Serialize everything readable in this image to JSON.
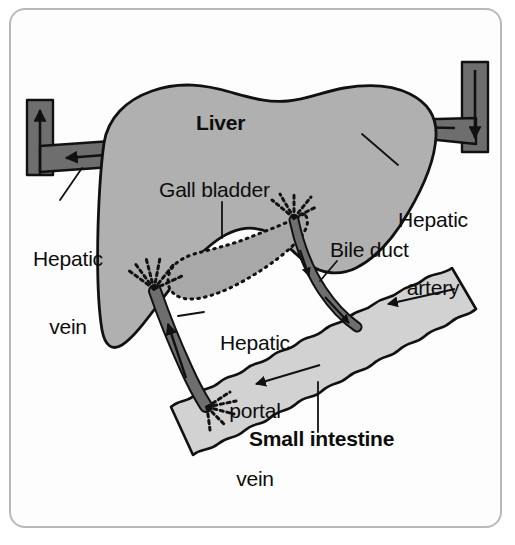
{
  "figure": {
    "kind": "anatomy-diagram",
    "border_color": "#b9b9b9",
    "background_color": "#ffffff"
  },
  "colors": {
    "liver_fill": "#b0b0b0",
    "liver_stroke": "#111111",
    "intestine_fill": "#d2d2d2",
    "intestine_stroke": "#111111",
    "vessel_fill": "#6e6e6e",
    "vessel_stroke": "#111111",
    "gallbladder_fill": "#a8a8a8",
    "gallbladder_stroke": "#111111",
    "text": "#0d0d0d",
    "leader_line": "#111111"
  },
  "labels": {
    "liver": {
      "text": "Liver",
      "weight": "bold",
      "x": 196,
      "y": 122
    },
    "gall_bladder": {
      "text": "Gall bladder",
      "weight": "regular",
      "x": 159,
      "y": 189
    },
    "hepatic_vein": {
      "line1": "Hepatic",
      "line2": "vein",
      "weight": "regular",
      "x": 18,
      "y": 213
    },
    "hepatic_artery": {
      "line1": "Hepatic",
      "line2": "artery",
      "weight": "regular",
      "x": 381,
      "y": 174
    },
    "bile_duct": {
      "text": "Bile duct",
      "weight": "regular",
      "x": 330,
      "y": 249
    },
    "hepatic_portal_vein": {
      "line1": "Hepatic",
      "line2": "portal",
      "line3": "vein",
      "weight": "regular",
      "x": 210,
      "y": 297
    },
    "small_intestine": {
      "text": "Small intestine",
      "weight": "bold",
      "x": 249,
      "y": 438
    }
  },
  "structures": [
    {
      "name": "liver",
      "type": "organ",
      "fill": "#b0b0b0"
    },
    {
      "name": "gall-bladder",
      "type": "organ",
      "outline": "dotted"
    },
    {
      "name": "small-intestine",
      "type": "organ",
      "fill": "#d2d2d2"
    },
    {
      "name": "hepatic-vein",
      "type": "vessel",
      "flow": "out-of-liver",
      "arrow_directions": [
        "left",
        "up"
      ]
    },
    {
      "name": "hepatic-artery",
      "type": "vessel",
      "flow": "into-liver",
      "arrow_directions": [
        "down",
        "left"
      ]
    },
    {
      "name": "hepatic-portal-vein",
      "type": "vessel",
      "flow": "intestine-to-liver",
      "arrow_directions": [
        "up"
      ]
    },
    {
      "name": "bile-duct",
      "type": "duct",
      "flow": "liver-to-intestine",
      "arrow_directions": [
        "down-right"
      ]
    },
    {
      "name": "intestine-flow-arrows",
      "type": "annotation",
      "count": 2,
      "arrow_directions": [
        "down-left",
        "down-left"
      ]
    }
  ]
}
